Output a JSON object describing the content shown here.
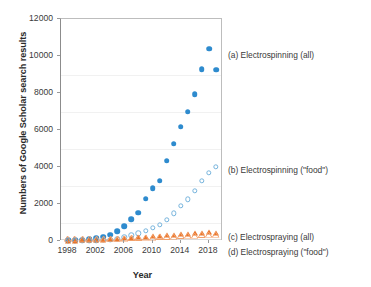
{
  "chart_data": {
    "type": "scatter",
    "title": "",
    "xlabel": "Year",
    "ylabel": "Numbers of Google Scholar search results",
    "xlim": [
      1997,
      2020
    ],
    "ylim": [
      0,
      12000
    ],
    "xticks": [
      1998,
      2002,
      2006,
      2010,
      2014,
      2018
    ],
    "yticks": [
      0,
      2000,
      4000,
      6000,
      8000,
      10000,
      12000
    ],
    "grid": "horizontal-faint",
    "legend_position": "right-inline",
    "x": [
      1998,
      1999,
      2000,
      2001,
      2002,
      2003,
      2004,
      2005,
      2006,
      2007,
      2008,
      2009,
      2010,
      2011,
      2012,
      2013,
      2014,
      2015,
      2016,
      2017,
      2018,
      2019
    ],
    "series": [
      {
        "name": "(a) Electrospinning (all)",
        "key": "electrospinning_all",
        "marker": "filled-circle",
        "color": "#2e8bce",
        "values": [
          30,
          40,
          60,
          90,
          150,
          230,
          330,
          520,
          800,
          1180,
          1540,
          2280,
          2850,
          3250,
          4330,
          5250,
          6170,
          7000,
          7950,
          9300,
          10400,
          9250
        ]
      },
      {
        "name": "(b) Electrospinning (\"food\")",
        "key": "electrospinning_food",
        "marker": "open-circle",
        "color": "#76b4dd",
        "values": [
          5,
          8,
          12,
          18,
          30,
          50,
          80,
          130,
          200,
          300,
          420,
          560,
          700,
          860,
          1150,
          1500,
          1900,
          2250,
          2700,
          3250,
          3700,
          4000
        ]
      },
      {
        "name": "(c) Electrospraying (all)",
        "key": "electrospraying_all",
        "marker": "filled-triangle",
        "color": "#e8762c",
        "values": [
          20,
          25,
          30,
          40,
          55,
          70,
          90,
          110,
          140,
          170,
          200,
          230,
          260,
          290,
          320,
          350,
          380,
          400,
          420,
          450,
          470,
          440
        ]
      },
      {
        "name": "(d) Electrospraying (\"food\")",
        "key": "electrospraying_food",
        "marker": "open-triangle",
        "color": "#f3a06a",
        "values": [
          2,
          3,
          4,
          6,
          8,
          11,
          15,
          20,
          26,
          34,
          44,
          56,
          70,
          85,
          100,
          120,
          140,
          160,
          180,
          200,
          220,
          235
        ]
      }
    ],
    "legend_entries": [
      {
        "label": "(a) Electrospinning (all)",
        "y_px": 50
      },
      {
        "label": "(b) Electrospinning (\"food\")",
        "y_px": 165
      },
      {
        "label": "(c) Electrospraying (all)",
        "y_px": 232
      },
      {
        "label": "(d) Electrospraying (\"food\")",
        "y_px": 247
      }
    ]
  }
}
